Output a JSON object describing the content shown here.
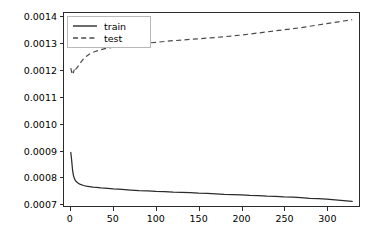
{
  "chart_data": {
    "type": "line",
    "title": "",
    "xlabel": "",
    "ylabel": "",
    "xlim": [
      -8,
      338
    ],
    "ylim": [
      0.00069,
      0.001415
    ],
    "grid": false,
    "legend_position": "upper left",
    "xticks": [
      "0",
      "50",
      "100",
      "150",
      "200",
      "250",
      "300"
    ],
    "xtick_values": [
      0,
      50,
      100,
      150,
      200,
      250,
      300
    ],
    "yticks": [
      "0.0007",
      "0.0008",
      "0.0009",
      "0.0010",
      "0.0011",
      "0.0012",
      "0.0013",
      "0.0014"
    ],
    "ytick_values": [
      0.0007,
      0.0008,
      0.0009,
      0.001,
      0.0011,
      0.0012,
      0.0013,
      0.0014
    ],
    "series": [
      {
        "name": "train",
        "style": "solid",
        "color": "#2b2b2b",
        "x": [
          0,
          1,
          2,
          3,
          4,
          5,
          6,
          7,
          8,
          10,
          12,
          15,
          18,
          22,
          26,
          30,
          35,
          40,
          50,
          60,
          70,
          80,
          90,
          100,
          110,
          120,
          130,
          140,
          150,
          160,
          170,
          180,
          190,
          200,
          210,
          220,
          230,
          240,
          250,
          260,
          270,
          280,
          290,
          300,
          310,
          320,
          330
        ],
        "values": [
          0.000891,
          0.000861,
          0.000826,
          0.000806,
          0.000795,
          0.000788,
          0.000783,
          0.00078,
          0.000777,
          0.000773,
          0.00077,
          0.000767,
          0.000765,
          0.000763,
          0.000761,
          0.00076,
          0.000758,
          0.000757,
          0.000754,
          0.000752,
          0.00075,
          0.000748,
          0.000747,
          0.000745,
          0.000744,
          0.000742,
          0.000741,
          0.00074,
          0.000738,
          0.000737,
          0.000736,
          0.000734,
          0.000733,
          0.000732,
          0.00073,
          0.000729,
          0.000727,
          0.000726,
          0.000724,
          0.000723,
          0.000721,
          0.000719,
          0.000718,
          0.000716,
          0.000713,
          0.00071,
          0.000707
        ]
      },
      {
        "name": "test",
        "style": "dashed",
        "color": "#4a4a4a",
        "x": [
          0,
          1,
          2,
          3,
          4,
          5,
          6,
          8,
          10,
          12,
          15,
          18,
          22,
          26,
          30,
          35,
          40,
          50,
          60,
          70,
          80,
          90,
          100,
          110,
          120,
          130,
          140,
          150,
          160,
          170,
          180,
          190,
          200,
          210,
          220,
          230,
          240,
          250,
          260,
          270,
          280,
          290,
          300,
          310,
          320,
          330
        ],
        "values": [
          0.001208,
          0.001192,
          0.001201,
          0.00119,
          0.001203,
          0.001197,
          0.001205,
          0.001213,
          0.001221,
          0.001231,
          0.001243,
          0.001252,
          0.001261,
          0.001267,
          0.001272,
          0.001277,
          0.001281,
          0.001287,
          0.001292,
          0.001296,
          0.001299,
          0.001302,
          0.001305,
          0.001308,
          0.001311,
          0.001313,
          0.001316,
          0.001318,
          0.001321,
          0.001323,
          0.001326,
          0.001329,
          0.001332,
          0.001336,
          0.00134,
          0.001344,
          0.001348,
          0.001352,
          0.001356,
          0.00136,
          0.001365,
          0.00137,
          0.001375,
          0.00138,
          0.001385,
          0.00139
        ]
      }
    ],
    "legend": [
      {
        "label": "train",
        "style": "solid"
      },
      {
        "label": "test",
        "style": "dashed"
      }
    ]
  }
}
